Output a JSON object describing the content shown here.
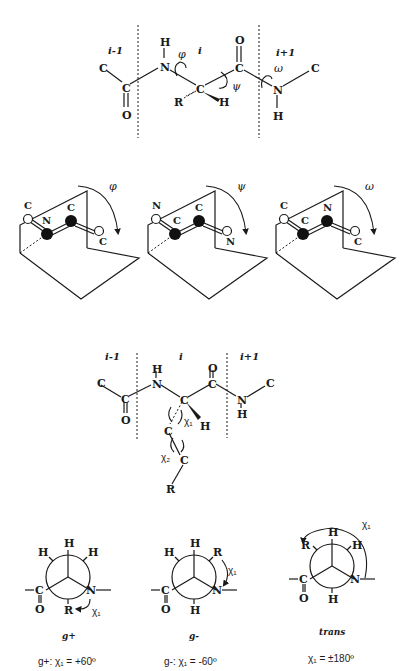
{
  "backbone_diagram": {
    "residue_labels": {
      "prev": "i-1",
      "current": "i",
      "next": "i+1"
    },
    "atoms": {
      "c_left": "C",
      "c_carbonyl_prev": "C",
      "o_prev": "O",
      "n_current": "N",
      "h_n": "H",
      "c_alpha": "C",
      "r_group": "R",
      "h_alpha": "H",
      "c_carbonyl": "C",
      "o_carbonyl": "O",
      "n_next": "N",
      "h_n_next": "H",
      "c_right": "C"
    },
    "torsions": {
      "phi": "φ",
      "psi": "ψ",
      "omega": "ω"
    }
  },
  "plane_panels": [
    {
      "angle": "φ",
      "left_top": "C",
      "left_center": "N",
      "right_center": "C",
      "right_end": "C"
    },
    {
      "angle": "ψ",
      "left_top": "N",
      "left_center": "C",
      "right_center": "C",
      "right_end": "N"
    },
    {
      "angle": "ω",
      "left_top": "C",
      "left_center": "C",
      "right_center": "N",
      "right_end": "C"
    }
  ],
  "sidechain_diagram": {
    "residue_labels": {
      "prev": "i-1",
      "current": "i",
      "next": "i+1"
    },
    "atoms": {
      "c_left": "C",
      "c_carbonyl_prev": "C",
      "o_prev": "O",
      "h_n": "H",
      "n_current": "N",
      "c_alpha": "C",
      "h_alpha": "H",
      "o_carbonyl": "O",
      "c_carbonyl": "C",
      "n_next": "N",
      "h_n_next": "H",
      "c_right": "C",
      "c_beta": "C",
      "c_gamma": "C",
      "r_group": "R"
    },
    "torsions": {
      "chi1": "χ₁",
      "chi2": "χ₂"
    }
  },
  "newman_projections": [
    {
      "name": "g+",
      "equation": "g+: χ₁ = +60º",
      "positions": {
        "top": "H",
        "upper_left": "H",
        "upper_right": "H",
        "bottom": "R"
      },
      "front": {
        "left": "C",
        "left_o": "O",
        "right": "N"
      },
      "chi": "χ₁"
    },
    {
      "name": "g-",
      "equation": "g-: χ₁ = -60º",
      "positions": {
        "top": "H",
        "upper_left": "H",
        "upper_right": "R",
        "bottom": "H"
      },
      "front": {
        "left": "C",
        "left_o": "O",
        "right": "N"
      },
      "chi": "χ₁"
    },
    {
      "name": "trans",
      "equation": "χ₁ = ±180º",
      "positions": {
        "top": "H",
        "upper_left": "R",
        "upper_right": "H",
        "bottom": "H"
      },
      "front": {
        "left": "C",
        "left_o": "O",
        "right": "N"
      },
      "chi": "χ₁"
    }
  ]
}
